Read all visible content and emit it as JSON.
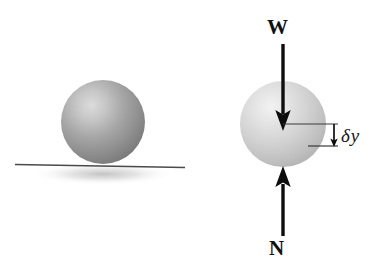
{
  "figure": {
    "background_color": "#ffffff",
    "width": 382,
    "height": 267
  },
  "left_panel": {
    "name": "sphere-on-surface",
    "sphere": {
      "icon": "sphere-shaded-icon",
      "center_x": 103,
      "center_y": 122,
      "radius": 42,
      "fill_light": "#d8d8d8",
      "fill_mid": "#9a9a9a",
      "fill_dark": "#6e6e6e",
      "highlight_x": 85,
      "highlight_y": 103
    },
    "ground_line": {
      "name": "ground-surface-line",
      "x1": 15,
      "y1": 165,
      "x2": 185,
      "y2": 168,
      "color": "#4a4a4a",
      "thickness": 1.6
    },
    "shadow": {
      "name": "contact-shadow",
      "color": "#c9c9c9"
    }
  },
  "right_panel": {
    "name": "free-body-diagram",
    "sphere": {
      "icon": "sphere-shaded-icon",
      "center_x": 283,
      "center_y": 124,
      "radius": 43,
      "fill_light": "#eaeaea",
      "fill_mid": "#c4c4c4",
      "fill_dark": "#a6a6a6",
      "highlight_x": 263,
      "highlight_y": 107
    },
    "forces": [
      {
        "name": "weight-force-arrow",
        "label": "W",
        "direction": "down",
        "shaft_x": 283,
        "shaft_top": 44,
        "shaft_bottom": 112,
        "tip_y": 130,
        "color": "#0d0d0d",
        "shaft_width": 3.4,
        "head_width": 15,
        "head_length": 20
      },
      {
        "name": "normal-force-arrow",
        "label": "N",
        "direction": "up",
        "shaft_x": 283,
        "shaft_bottom": 236,
        "shaft_top": 186,
        "tip_y": 167,
        "color": "#0d0d0d",
        "shaft_width": 3.4,
        "head_width": 15,
        "head_length": 20
      }
    ],
    "displacement": {
      "name": "delta-y-dimension",
      "label_delta": "δ",
      "label_variable": "y",
      "label_full": "δy",
      "upper_line": {
        "x1": 283,
        "y": 124,
        "x2": 338
      },
      "lower_line": {
        "x1": 308,
        "y": 146,
        "x2": 338
      },
      "arrow_x": 334,
      "arrow_top": 124,
      "arrow_bottom": 146,
      "line_color": "#3a3a3a",
      "arrow_color": "#0d0d0d"
    }
  }
}
